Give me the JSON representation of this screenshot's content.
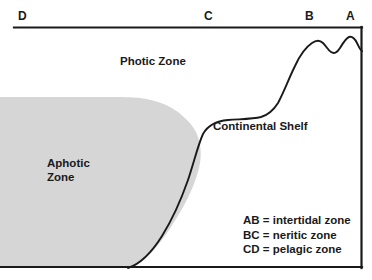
{
  "diagram": {
    "colors": {
      "line": "#1a1a1a",
      "aphotic_fill": "#d6d6d6",
      "background": "#ffffff",
      "text": "#1a1a1a"
    },
    "axis_markers": [
      {
        "label": "D",
        "x": 18,
        "y": 10
      },
      {
        "label": "C",
        "x": 204,
        "y": 10
      },
      {
        "label": "B",
        "x": 305,
        "y": 10
      },
      {
        "label": "A",
        "x": 346,
        "y": 10
      }
    ],
    "zone_labels": [
      {
        "name": "photic",
        "text": "Photic Zone",
        "x": 120,
        "y": 55
      },
      {
        "name": "aphotic",
        "text": "Aphotic\nZone",
        "x": 47,
        "y": 157
      },
      {
        "name": "continental-shelf",
        "text": "Continental Shelf",
        "x": 213,
        "y": 120
      }
    ],
    "legend": {
      "entries": [
        "AB = intertidal zone",
        "BC = neritic zone",
        "CD = pelagic zone"
      ]
    }
  }
}
